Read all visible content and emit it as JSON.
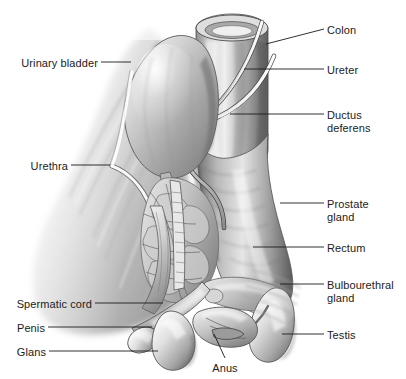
{
  "figure": {
    "width": 406,
    "height": 379,
    "background_color": "#ffffff",
    "line_color": "#1b1b1b",
    "text_color": "#1b1b1b",
    "style": "grayscale pencil/airbrush medical illustration"
  },
  "labels": [
    {
      "id": "urinary-bladder",
      "text": "Urinary bladder",
      "side": "left",
      "text_x": 98,
      "text_y": 57,
      "leader": {
        "x1": 101,
        "y1": 62,
        "x2": 131,
        "y2": 62
      }
    },
    {
      "id": "urethra",
      "text": "Urethra",
      "side": "left",
      "text_x": 68,
      "text_y": 160,
      "leader": {
        "x1": 71,
        "y1": 165,
        "x2": 110,
        "y2": 165
      }
    },
    {
      "id": "spermatic-cord",
      "text": "Spermatic cord",
      "side": "left",
      "text_x": 92,
      "text_y": 298,
      "leader": {
        "x1": 95,
        "y1": 303,
        "x2": 163,
        "y2": 303
      }
    },
    {
      "id": "penis",
      "text": "Penis",
      "side": "left",
      "text_x": 45,
      "text_y": 322,
      "leader": {
        "x1": 48,
        "y1": 327,
        "x2": 152,
        "y2": 327
      }
    },
    {
      "id": "glans",
      "text": "Glans",
      "side": "left",
      "text_x": 46,
      "text_y": 346,
      "leader": {
        "x1": 49,
        "y1": 351,
        "x2": 158,
        "y2": 351
      }
    },
    {
      "id": "colon",
      "text": "Colon",
      "side": "right",
      "text_x": 327,
      "text_y": 24,
      "leader": {
        "x1": 324,
        "y1": 29,
        "x2": 266,
        "y2": 44
      }
    },
    {
      "id": "ureter",
      "text": "Ureter",
      "side": "right",
      "text_x": 327,
      "text_y": 64,
      "leader": {
        "x1": 324,
        "y1": 69,
        "x2": 244,
        "y2": 69
      }
    },
    {
      "id": "ductus-deferens",
      "text": "Ductus deferens",
      "side": "right",
      "text_x": 327,
      "text_y": 109,
      "leader": {
        "x1": 324,
        "y1": 114,
        "x2": 230,
        "y2": 114
      }
    },
    {
      "id": "prostate-gland",
      "text": "Prostate\ngland",
      "side": "right",
      "text_x": 327,
      "text_y": 198,
      "leader": {
        "x1": 324,
        "y1": 203,
        "x2": 280,
        "y2": 203
      }
    },
    {
      "id": "rectum",
      "text": "Rectum",
      "side": "right",
      "text_x": 327,
      "text_y": 242,
      "leader": {
        "x1": 324,
        "y1": 247,
        "x2": 253,
        "y2": 247
      }
    },
    {
      "id": "bulbourethral-gland",
      "text": "Bulbourethral\ngland",
      "side": "right",
      "text_x": 327,
      "text_y": 279,
      "leader": {
        "x1": 324,
        "y1": 284,
        "x2": 280,
        "y2": 284
      }
    },
    {
      "id": "testis",
      "text": "Testis",
      "side": "right",
      "text_x": 327,
      "text_y": 329,
      "leader": {
        "x1": 324,
        "y1": 334,
        "x2": 282,
        "y2": 334
      }
    },
    {
      "id": "anus",
      "text": "Anus",
      "side": "center",
      "text_x": 225,
      "text_y": 362,
      "leader": {
        "x1": 225,
        "y1": 358,
        "x2": 214,
        "y2": 334
      }
    }
  ],
  "structures": [
    {
      "id": "colon-tube",
      "name": "Colon"
    },
    {
      "id": "urinary-bladder",
      "name": "Urinary bladder"
    },
    {
      "id": "ureter-tube",
      "name": "Ureter"
    },
    {
      "id": "ductus-deferens",
      "name": "Ductus deferens"
    },
    {
      "id": "prostate",
      "name": "Prostate gland"
    },
    {
      "id": "rectum",
      "name": "Rectum"
    },
    {
      "id": "bulbourethral",
      "name": "Bulbourethral gland"
    },
    {
      "id": "testis-right",
      "name": "Testis"
    },
    {
      "id": "testis-left",
      "name": "Testis"
    },
    {
      "id": "anus",
      "name": "Anus"
    },
    {
      "id": "penis-shaft",
      "name": "Penis"
    },
    {
      "id": "glans",
      "name": "Glans"
    },
    {
      "id": "spermatic-cord",
      "name": "Spermatic cord"
    },
    {
      "id": "urethra",
      "name": "Urethra"
    },
    {
      "id": "pelvic-muscle",
      "name": "Pelvic musculature"
    }
  ]
}
